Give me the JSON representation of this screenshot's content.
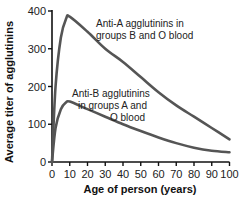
{
  "chart_data": {
    "type": "line",
    "title": "",
    "xlabel": "Age of person (years)",
    "ylabel": "Average titer of agglutinins",
    "xlim": [
      0,
      100
    ],
    "ylim": [
      0,
      400
    ],
    "x_ticks": [
      0,
      10,
      20,
      30,
      40,
      50,
      60,
      70,
      80,
      90,
      100
    ],
    "y_ticks": [
      0,
      100,
      200,
      300,
      400
    ],
    "grid": false,
    "legend": "none (inline annotations)",
    "x": [
      0,
      2,
      5,
      8,
      10,
      20,
      30,
      40,
      50,
      60,
      70,
      80,
      90,
      100
    ],
    "series": [
      {
        "name": "Anti-A agglutinins in groups B and O blood",
        "color": "#555555",
        "values": [
          0,
          200,
          330,
          380,
          385,
          345,
          300,
          265,
          225,
          185,
          150,
          120,
          90,
          60
        ]
      },
      {
        "name": "Anti-B agglutinins in groups A and O blood",
        "color": "#555555",
        "values": [
          0,
          90,
          140,
          158,
          160,
          140,
          120,
          100,
          82,
          65,
          50,
          38,
          30,
          26
        ]
      }
    ],
    "annotations": [
      {
        "lines": [
          "Anti-A agglutinins in",
          "groups B and O blood"
        ],
        "series": 0
      },
      {
        "lines": [
          "Anti-B agglutinins",
          "in groups A and",
          "O blood"
        ],
        "series": 1
      }
    ]
  },
  "labels": {
    "xlabel": "Age of person (years)",
    "ylabel": "Average titer of agglutinins",
    "annotA1": "Anti-A agglutinins in",
    "annotA2": "groups B and O blood",
    "annotB1": "Anti-B agglutinins",
    "annotB2": "in groups A and",
    "annotB3": "O blood"
  },
  "ticks": {
    "x": [
      "0",
      "10",
      "20",
      "30",
      "40",
      "50",
      "60",
      "70",
      "80",
      "90",
      "100"
    ],
    "y": [
      "0",
      "100",
      "200",
      "300",
      "400"
    ]
  }
}
